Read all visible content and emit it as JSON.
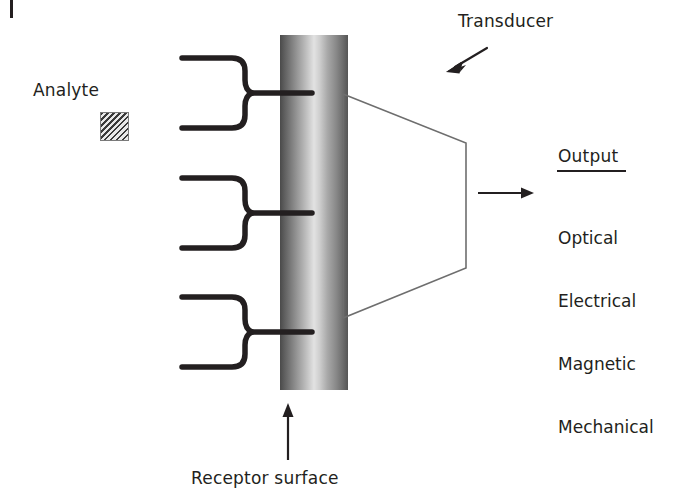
{
  "diagram": {
    "labels": {
      "analyte": "Analyte",
      "transducer": "Transducer",
      "receptor_surface": "Receptor surface",
      "output_title": "Output"
    },
    "output_modalities": [
      "Optical",
      "Electrical",
      "Magnetic",
      "Mechanical"
    ],
    "colors": {
      "text": "#231f20",
      "stroke": "#231f20",
      "funnel_stroke": "#6e6e6e",
      "analyte_fill": "#c9c9c9",
      "analyte_hatch": "#3a3a3a",
      "column_dark": "#4a4a4a",
      "column_light": "#e2e2e2",
      "background": "#ffffff"
    },
    "receptors": [
      {
        "name": "receptor-antibody-top",
        "stem_y": 93
      },
      {
        "name": "receptor-antibody-middle",
        "stem_y": 213
      },
      {
        "name": "receptor-antibody-bottom",
        "stem_y": 332
      }
    ],
    "arrows": [
      {
        "name": "transducer-pointer",
        "from": [
          487,
          48
        ],
        "to": [
          449,
          71
        ]
      },
      {
        "name": "output-arrow",
        "from": [
          478,
          193
        ],
        "to": [
          534,
          193
        ]
      },
      {
        "name": "receptor-surface-arrow",
        "from": [
          288,
          460
        ],
        "to": [
          288,
          404
        ]
      }
    ],
    "funnel": {
      "name": "signal-funnel",
      "points": "343,94 466,143 466,268 343,318"
    }
  }
}
